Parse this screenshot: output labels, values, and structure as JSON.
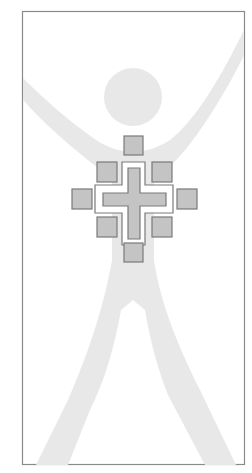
{
  "logo": {
    "description": "Stylized human figure with raised arms and a cross emblem on the chest",
    "colors": {
      "background": "#ffffff",
      "frame": "#8a8a8a",
      "figure": "#e6e6e6",
      "square_fill": "#c4c4c4",
      "square_stroke": "#7a7a7a",
      "cross_fill": "#c4c4c4",
      "cross_stroke": "#7a7a7a"
    },
    "frame": {
      "x": 22,
      "y": 11,
      "w": 223,
      "h": 454
    },
    "head": {
      "cx": 133,
      "cy": 97,
      "r": 29
    },
    "squares": [
      {
        "name": "top",
        "x": 124,
        "y": 136,
        "s": 19
      },
      {
        "name": "upper-left",
        "x": 97,
        "y": 162,
        "s": 20
      },
      {
        "name": "upper-right",
        "x": 152,
        "y": 162,
        "s": 20
      },
      {
        "name": "left",
        "x": 72,
        "y": 189,
        "s": 20
      },
      {
        "name": "right",
        "x": 177,
        "y": 189,
        "s": 20
      },
      {
        "name": "lower-left",
        "x": 97,
        "y": 217,
        "s": 20
      },
      {
        "name": "lower-right",
        "x": 152,
        "y": 217,
        "s": 20
      },
      {
        "name": "bottom",
        "x": 124,
        "y": 243,
        "s": 19
      }
    ]
  }
}
